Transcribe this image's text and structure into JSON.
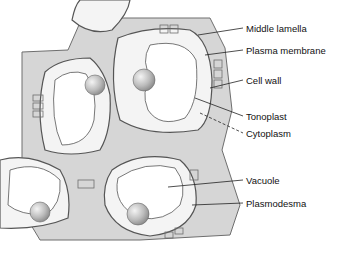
{
  "diagram": {
    "type": "plant cell tissue illustration",
    "colors": {
      "wall_fill": "#d6d6d6",
      "wall_stroke": "#6e6e6e",
      "cytoplasm": "#f4f4f4",
      "vacuole": "#ffffff",
      "nucleus": "#bdbdbd",
      "leader": "#222222"
    },
    "labels": [
      {
        "id": "middle-lamella",
        "text": "Middle lamella"
      },
      {
        "id": "plasma-membrane",
        "text": "Plasma membrane"
      },
      {
        "id": "cell-wall",
        "text": "Cell wall"
      },
      {
        "id": "tonoplast",
        "text": "Tonoplast"
      },
      {
        "id": "cytoplasm",
        "text": "Cytoplasm"
      },
      {
        "id": "vacuole",
        "text": "Vacuole"
      },
      {
        "id": "plasmodesma",
        "text": "Plasmodesma"
      }
    ]
  }
}
